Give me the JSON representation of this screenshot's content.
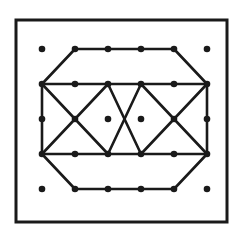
{
  "diagram": {
    "colors": {
      "stroke": "#1a1a1a",
      "dot": "#1a1a1a",
      "background": "#ffffff"
    },
    "frame": {
      "x": 16,
      "y": 20,
      "width": 211,
      "height": 202
    },
    "grid": {
      "columns": 6,
      "rows": 5,
      "x": [
        42,
        75,
        108,
        141,
        174,
        207
      ],
      "y": [
        49,
        84,
        119,
        154,
        189
      ]
    },
    "segments": [
      [
        [
          1,
          0
        ],
        [
          4,
          0
        ]
      ],
      [
        [
          1,
          0
        ],
        [
          0,
          1
        ]
      ],
      [
        [
          4,
          0
        ],
        [
          5,
          1
        ]
      ],
      [
        [
          0,
          1
        ],
        [
          5,
          1
        ]
      ],
      [
        [
          0,
          3
        ],
        [
          5,
          3
        ]
      ],
      [
        [
          0,
          1
        ],
        [
          0,
          3
        ]
      ],
      [
        [
          5,
          1
        ],
        [
          5,
          3
        ]
      ],
      [
        [
          0,
          3
        ],
        [
          1,
          4
        ]
      ],
      [
        [
          5,
          3
        ],
        [
          4,
          4
        ]
      ],
      [
        [
          1,
          4
        ],
        [
          4,
          4
        ]
      ],
      [
        [
          0,
          1
        ],
        [
          2,
          3
        ]
      ],
      [
        [
          0,
          3
        ],
        [
          2,
          1
        ]
      ],
      [
        [
          2,
          1
        ],
        [
          3,
          3
        ]
      ],
      [
        [
          3,
          1
        ],
        [
          2,
          3
        ]
      ],
      [
        [
          3,
          1
        ],
        [
          5,
          3
        ]
      ],
      [
        [
          3,
          3
        ],
        [
          5,
          1
        ]
      ]
    ]
  }
}
